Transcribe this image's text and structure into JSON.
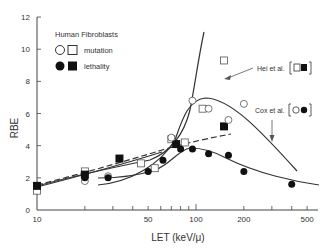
{
  "chart_data": {
    "type": "line",
    "title": "",
    "xlabel": "LET (keV/μ)",
    "ylabel": "RBE",
    "xscale": "log",
    "xlim": [
      10,
      550
    ],
    "ylim": [
      0,
      12
    ],
    "grid": false,
    "x_tick_labels": [
      "10",
      "50",
      "100",
      "200",
      "500"
    ],
    "y_tick_labels": [
      "0",
      "2",
      "4",
      "6",
      "8",
      "10",
      "12"
    ],
    "legend": {
      "title": "Human Fibroblasts",
      "position": "upper-left",
      "entries": [
        {
          "label": "mutation",
          "markers": [
            "open-circle",
            "open-square"
          ]
        },
        {
          "label": "lethality",
          "markers": [
            "filled-circle",
            "filled-square"
          ]
        }
      ]
    },
    "annotations": [
      {
        "text": "Hei et al.",
        "markers": [
          "open-square",
          "filled-square"
        ]
      },
      {
        "text": "Cox et al.",
        "markers": [
          "open-circle",
          "filled-circle"
        ]
      }
    ],
    "series": [
      {
        "name": "Hei et al. mutation",
        "marker": "open-square",
        "line": "solid",
        "x": [
          10,
          20,
          45,
          55,
          70,
          85,
          110,
          150
        ],
        "y": [
          1.2,
          2.4,
          2.9,
          2.6,
          4.4,
          4.2,
          6.3,
          9.3
        ]
      },
      {
        "name": "Hei et al. lethality",
        "marker": "filled-square",
        "line": "dashed",
        "x": [
          10,
          20,
          33,
          75,
          150
        ],
        "y": [
          1.5,
          2.2,
          3.2,
          4.1,
          5.2
        ]
      },
      {
        "name": "Cox et al. mutation",
        "marker": "open-circle",
        "line": "solid",
        "x": [
          20,
          28,
          70,
          95,
          120,
          160,
          200
        ],
        "y": [
          1.8,
          2.1,
          4.5,
          6.8,
          6.3,
          5.6,
          6.6
        ]
      },
      {
        "name": "Cox et al. lethality",
        "marker": "filled-circle",
        "line": "solid",
        "x": [
          20,
          28,
          50,
          62,
          80,
          95,
          120,
          160,
          200,
          400
        ],
        "y": [
          2.0,
          2.0,
          2.4,
          3.1,
          3.8,
          3.8,
          3.5,
          3.4,
          2.4,
          1.6
        ]
      }
    ]
  }
}
